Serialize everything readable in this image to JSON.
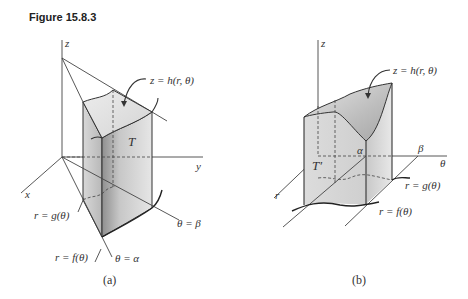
{
  "figure": {
    "title": "Figure 15.8.3"
  },
  "panel_a": {
    "caption": "(a)",
    "axis_z": "z",
    "axis_y": "y",
    "axis_x": "x",
    "surface_label": "z = h(r, θ)",
    "region_label": "T",
    "inner_curve_label": "r = g(θ)",
    "outer_curve_label": "r = f(θ)",
    "ray_alpha_label": "θ = α",
    "ray_beta_label": "θ = β"
  },
  "panel_b": {
    "caption": "(b)",
    "axis_z": "z",
    "axis_theta": "θ",
    "axis_r": "r",
    "surface_label": "z = h(r, θ)",
    "region_label": "T′",
    "alpha_label": "α",
    "beta_label": "β",
    "inner_curve_label": "r = g(θ)",
    "outer_curve_label": "r = f(θ)"
  },
  "colors": {
    "fill_light": "#e4e4e4",
    "fill_mid": "#cfcfcf",
    "fill_dark": "#a9a9a9",
    "line": "#333333"
  }
}
